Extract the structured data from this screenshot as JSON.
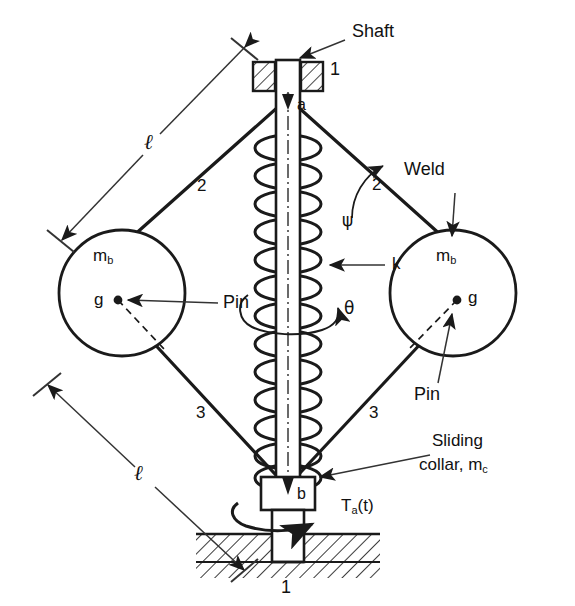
{
  "diagram": {
    "labels": {
      "shaft": "Shaft",
      "weld": "Weld",
      "pin_left": "Pin",
      "pin_right": "Pin",
      "sliding_collar_line1": "Sliding",
      "sliding_collar_line2": "collar, m",
      "sliding_collar_sub": "c",
      "ground_top": "1",
      "ground_bottom": "1",
      "link_upper_left": "2",
      "link_upper_right": "2",
      "link_lower_left": "3",
      "link_lower_right": "3",
      "joint_a": "a",
      "joint_b": "b",
      "spring_k": "k",
      "angle_psi": "ψ",
      "angle_theta": "θ",
      "length_upper": "ℓ",
      "length_lower": "ℓ",
      "mass_left": "m",
      "mass_left_sub": "b",
      "mass_right": "m",
      "mass_right_sub": "b",
      "cg_left": "g",
      "cg_right": "g",
      "torque": "T",
      "torque_sub": "a",
      "torque_arg": "(t)"
    },
    "colors": {
      "stroke": "#1a1a1a",
      "background": "#ffffff",
      "thin": "#444444"
    }
  }
}
